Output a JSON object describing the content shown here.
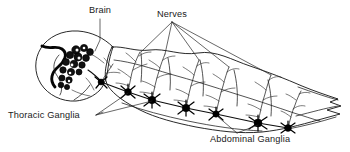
{
  "figure": {
    "name": "insect-nervous-system-diagram",
    "type": "labeled line-art anatomical diagram",
    "background_color": "#ffffff",
    "ink_color": "#111111",
    "width": 350,
    "height": 152
  },
  "labels": {
    "brain": {
      "text": "Brain",
      "x": 100,
      "y": 13,
      "anchor": "middle"
    },
    "nerves": {
      "text": "Nerves",
      "x": 172,
      "y": 17,
      "anchor": "middle"
    },
    "thoracic_ganglia": {
      "text": "Thoracic Ganglia",
      "x": 8,
      "y": 118,
      "anchor": "start"
    },
    "abdominal_ganglia": {
      "text": "Abdominal Ganglia",
      "x": 210,
      "y": 141,
      "anchor": "start"
    }
  },
  "structures": {
    "body_outline_label": "insect body silhouette",
    "head_label": "head capsule",
    "brain_label": "brain ganglion cluster",
    "nerve_cord_label": "ventral nerve cord",
    "ganglia_count": 7,
    "nerve_branch_count": 7
  },
  "geometry": {
    "body_outline": "M 113 46 L 134 53 L 148 48 L 172 56 L 196 49 L 222 60 L 252 69 L 278 78 L 300 86 L 318 92 L 333 97 L 341 101 L 331 104 L 340 107 L 328 111 L 339 115 L 318 120 L 300 125 L 278 130 L 252 131 L 222 128 L 196 124 L 172 120 L 148 114 L 126 106 L 112 98 L 106 88 L 108 74 L 110 58 Z",
    "head_outline": "M 112 46 C 100 36 80 34 66 38 C 50 43 40 54 40 66 C 40 78 48 88 60 93 C 70 97 82 97 90 93 C 98 89 104 82 106 74 C 108 64 110 54 112 46 Z",
    "head_band": "M 44 47 C 52 52 58 47 64 52 C 70 57 66 64 60 68 C 54 72 50 80 56 86",
    "head_inner": "M 62 88 C 66 82 62 76 58 72 C 54 68 56 62 60 58",
    "neck_line": "M 104 80 C 110 84 116 90 120 96",
    "nerve_cord": "M 100 82 L 118 88 L 140 96 L 162 103 L 184 108 L 206 112 L 228 116 L 252 122 L 272 126 L 288 128",
    "dorsal_inner": "M 116 60 L 140 66 L 166 73 L 192 79 L 218 85 L 244 92 L 268 99 L 292 106 L 312 112",
    "tail_lines": [
      "M 300 92 L 326 100 L 340 104",
      "M 296 118 L 322 112 L 338 108",
      "M 288 128 L 312 124 L 334 118"
    ],
    "ganglia": [
      {
        "x": 100,
        "y": 82,
        "r": 3.2,
        "name": "ganglion-1"
      },
      {
        "x": 128,
        "y": 92,
        "r": 3.6,
        "name": "ganglion-2"
      },
      {
        "x": 152,
        "y": 100,
        "r": 4.0,
        "name": "ganglion-3"
      },
      {
        "x": 186,
        "y": 108,
        "r": 4.0,
        "name": "ganglion-4"
      },
      {
        "x": 216,
        "y": 114,
        "r": 3.4,
        "name": "ganglion-5"
      },
      {
        "x": 258,
        "y": 123,
        "r": 4.2,
        "name": "ganglion-6"
      },
      {
        "x": 288,
        "y": 128,
        "r": 3.8,
        "name": "ganglion-7"
      }
    ],
    "nerve_branches": [
      "M 128 92 C 130 82 132 74 134 66 C 136 60 138 56 140 52",
      "M 152 100 C 154 90 156 80 158 72 C 160 64 162 58 164 54",
      "M 186 108 C 188 98 190 88 192 80 C 194 72 196 66 198 60",
      "M 216 114 C 218 104 220 94 222 86 C 224 78 226 72 228 66",
      "M 258 123 C 260 113 262 103 264 95 C 266 87 268 81 270 75",
      "M 288 128 C 290 120 292 112 294 106 C 296 100 298 96 300 92",
      "M 100 82 C 104 76 108 70 112 64"
    ],
    "leaders": {
      "brain": [
        "M 100 19 L 100 42 L 96 54"
      ],
      "nerves": [
        "M 172 22 L 142 52",
        "M 172 22 L 164 54",
        "M 172 22 L 198 60",
        "M 172 22 L 228 66",
        "M 172 22 L 270 75"
      ],
      "thoracic": [
        "M 98 115 L 130 94",
        "M 98 115 L 154 102"
      ],
      "abdominal": [
        "M 236 133 L 216 116",
        "M 236 133 L 258 125"
      ]
    }
  }
}
